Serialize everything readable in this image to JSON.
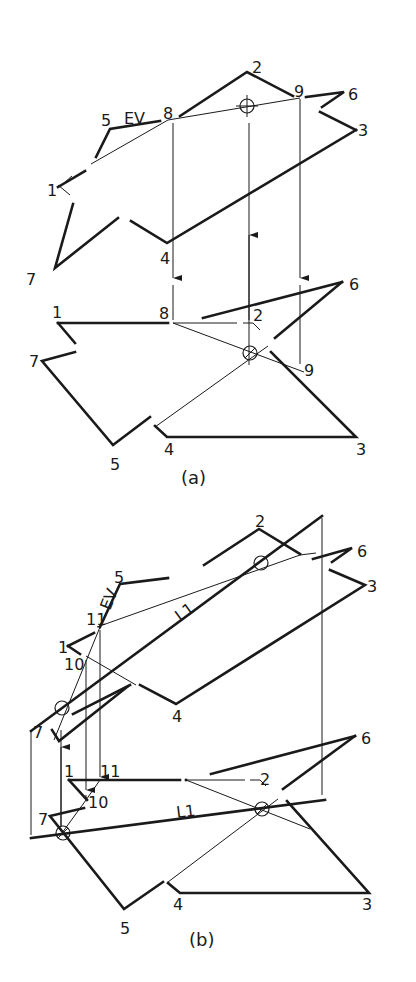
{
  "figure_a": {
    "caption": "(a)",
    "top_view_labels": {
      "p1": "1",
      "p2": "2",
      "p3": "3",
      "p4": "4",
      "p5": "5",
      "p6": "6",
      "p7": "7",
      "p8": "8",
      "p9": "9",
      "ev": "EV"
    },
    "front_view_labels": {
      "p1": "1",
      "p2": "2",
      "p3": "3",
      "p4": "4",
      "p5": "5",
      "p6": "6",
      "p7": "7",
      "p8": "8",
      "p9": "9"
    }
  },
  "figure_b": {
    "caption": "(b)",
    "top_view_labels": {
      "p1": "1",
      "p2": "2",
      "p3": "3",
      "p4": "4",
      "p5": "5",
      "p6": "6",
      "p7": "7",
      "p10": "10",
      "p11": "11",
      "ev": "EV",
      "line": "L1"
    },
    "front_view_labels": {
      "p1": "1",
      "p2": "2",
      "p3": "3",
      "p4": "4",
      "p5": "5",
      "p6": "6",
      "p7": "7",
      "p10": "10",
      "p11": "11",
      "line": "L1"
    }
  }
}
